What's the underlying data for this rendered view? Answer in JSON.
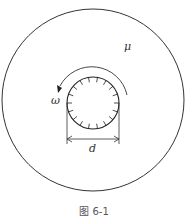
{
  "diagram": {
    "labels": {
      "viscosity": "μ",
      "angular_velocity": "ω",
      "diameter": "d"
    },
    "caption": "图 6-1"
  }
}
